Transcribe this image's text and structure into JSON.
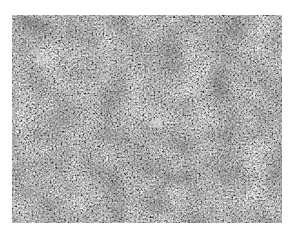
{
  "image": {
    "kind": "grayscale micrograph texture",
    "colors": {
      "background": "#ffffff",
      "base_tone": "#8a8a8a",
      "dark_tone": "#3a3a3a",
      "light_tone": "#e0e0e0"
    }
  }
}
